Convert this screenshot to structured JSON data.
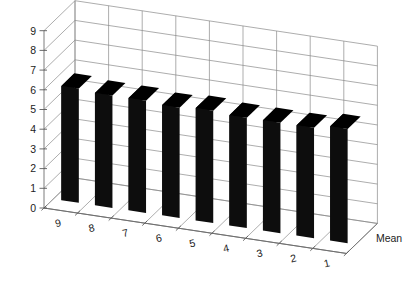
{
  "chart_data": {
    "type": "bar",
    "render": "3d-bar",
    "title": "",
    "subtitle": "",
    "xlabel": "",
    "ylabel": "",
    "zlabel": "Mean",
    "legend": [],
    "legend_position": "none",
    "grid": true,
    "categories": [
      "9",
      "8",
      "7",
      "6",
      "5",
      "4",
      "3",
      "2",
      "1"
    ],
    "values": [
      5.8,
      5.7,
      5.7,
      5.6,
      5.7,
      5.6,
      5.6,
      5.6,
      5.8
    ],
    "ylim": [
      0,
      9
    ],
    "yticks": [
      "0",
      "1",
      "2",
      "3",
      "4",
      "5",
      "6",
      "7",
      "8",
      "9"
    ],
    "ytick_values": [
      0,
      1,
      2,
      3,
      4,
      5,
      6,
      7,
      8,
      9
    ],
    "bar_color": "#000000",
    "grid_color": "#8a8a8a",
    "background_color": "#ffffff"
  },
  "axes": {
    "y_axis_name": "value-axis",
    "x_axis_name": "category-axis",
    "depth_axis_label": "Mean"
  }
}
